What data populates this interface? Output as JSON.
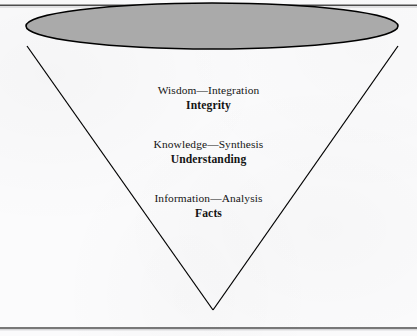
{
  "figure": {
    "type": "inverted-cone-hierarchy-diagram",
    "background_color": "#fbfbfc",
    "rules": {
      "top_rule_color": "#4d4d4d",
      "bottom_rule_color": "#4d4d4d"
    },
    "ellipse": {
      "name": "cone-top-ellipse",
      "fill_color": "#aaaaaa",
      "stroke_color": "#000000",
      "center_x": 212,
      "center_y": 26,
      "radius_x": 186,
      "radius_y": 23
    },
    "cone": {
      "name": "cone-body",
      "stroke_color": "#000000",
      "left_vertex_x": 27,
      "left_vertex_y": 46,
      "right_vertex_x": 398,
      "right_vertex_y": 46,
      "apex_x": 213,
      "apex_y": 310
    },
    "tiers": [
      {
        "id": "wisdom",
        "primary": "Wisdom—Integration",
        "secondary": "Integrity"
      },
      {
        "id": "knowledge",
        "primary": "Knowledge—Synthesis",
        "secondary": "Understanding"
      },
      {
        "id": "information",
        "primary": "Information—Analysis",
        "secondary": "Facts"
      }
    ]
  }
}
